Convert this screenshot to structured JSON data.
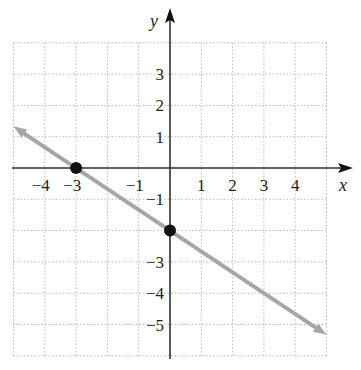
{
  "chart_data": {
    "type": "line",
    "title": "",
    "xlabel": "x",
    "ylabel": "y",
    "xlim": [
      -5,
      5
    ],
    "ylim": [
      -6,
      4
    ],
    "grid": true,
    "x_tick_labels": [
      "−4",
      "−3",
      "−1",
      "1",
      "2",
      "3",
      "4"
    ],
    "x_tick_values": [
      -4,
      -3,
      -1,
      1,
      2,
      3,
      4
    ],
    "y_tick_labels": [
      "3",
      "2",
      "1",
      "−1",
      "−3",
      "−4",
      "−5"
    ],
    "y_tick_values": [
      3,
      2,
      1,
      -1,
      -3,
      -4,
      -5
    ],
    "series": [
      {
        "name": "line",
        "equation": "y = -2/3 x - 2",
        "x": [
          -5,
          5
        ],
        "y": [
          1.33,
          -5.33
        ],
        "color": "#a6a6a6",
        "arrows_both_ends": true
      }
    ],
    "points": [
      {
        "x": -3,
        "y": 0,
        "label": "x-intercept"
      },
      {
        "x": 0,
        "y": -2,
        "label": "y-intercept"
      }
    ],
    "colors": {
      "axis": "#333333",
      "grid": "#b8b8b8",
      "line": "#a6a6a6",
      "point": "#111111"
    }
  }
}
